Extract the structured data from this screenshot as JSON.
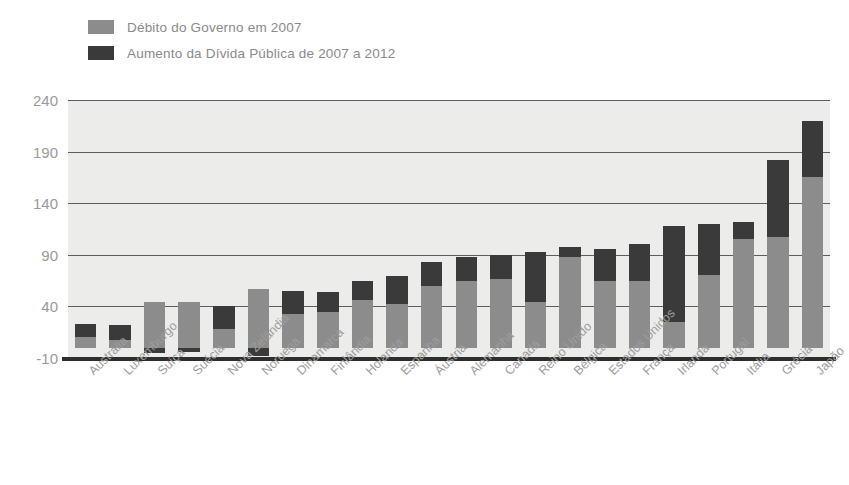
{
  "legend": {
    "items": [
      {
        "label": "Débito do Governo em 2007",
        "color": "#8c8c8c",
        "key": "base"
      },
      {
        "label": "Aumento da Dívida Pública de 2007 a 2012",
        "color": "#3a3a3a",
        "key": "increase"
      }
    ]
  },
  "axis": {
    "y_ticks": [
      "240",
      "190",
      "140",
      "90",
      "40",
      "-10"
    ]
  },
  "colors": {
    "base": "#8c8c8c",
    "increase": "#3a3a3a",
    "plot_background": "#ececeb",
    "gridline": "#5e5e5e",
    "zero_line": "#2e2e2e",
    "tick_text": "#9a9a9a",
    "category_text": "#9d9d9d",
    "legend_text": "#8a8a8a"
  },
  "chart_data": {
    "type": "bar",
    "title": "",
    "subtitle": "",
    "xlabel": "",
    "ylabel": "",
    "ylim": [
      -10,
      240
    ],
    "yticks": [
      -10,
      40,
      90,
      140,
      190,
      240
    ],
    "grid": true,
    "stacked": true,
    "legend_position": "top-left",
    "categories": [
      "Austrália",
      "Luxemburgo",
      "Suíça",
      "Suécia",
      "Nova Zelândia",
      "Noruega",
      "Dinamarca",
      "Finlândia",
      "Holanda",
      "Espanha",
      "Áustria",
      "Alemanha",
      "Canadá",
      "Reino Unido",
      "Bélgica",
      "Estados Unidos",
      "França",
      "Irlanda",
      "Portugal",
      "Itália",
      "Grécia",
      "Japão"
    ],
    "series": [
      {
        "name": "Débito do Governo em 2007",
        "values": [
          10,
          7,
          44,
          44,
          18,
          57,
          33,
          35,
          46,
          42,
          60,
          65,
          67,
          44,
          88,
          65,
          65,
          25,
          70,
          105,
          107,
          165
        ]
      },
      {
        "name": "Aumento da Dívida Pública de 2007 a 2012",
        "values": [
          13,
          15,
          -5,
          -4,
          22,
          -8,
          22,
          19,
          19,
          27,
          23,
          23,
          23,
          49,
          10,
          31,
          35,
          93,
          50,
          17,
          75,
          55
        ]
      }
    ],
    "totals": [
      23,
      22,
      39,
      40,
      40,
      49,
      55,
      54,
      65,
      69,
      83,
      88,
      90,
      93,
      98,
      96,
      100,
      118,
      120,
      122,
      182,
      220
    ]
  }
}
